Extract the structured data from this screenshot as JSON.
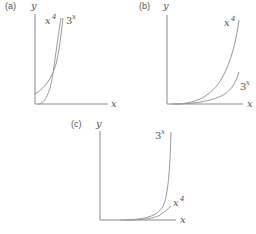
{
  "figure": {
    "panels": [
      {
        "id": "a",
        "label": "(a)",
        "y_axis_label": "y",
        "x_axis_label": "x",
        "curves": [
          {
            "name": "x4",
            "base": "x",
            "exponent": "4"
          },
          {
            "name": "3x",
            "base": "3",
            "exponent": "x"
          }
        ]
      },
      {
        "id": "b",
        "label": "(b)",
        "y_axis_label": "y",
        "x_axis_label": "x",
        "curves": [
          {
            "name": "x4",
            "base": "x",
            "exponent": "4"
          },
          {
            "name": "3x",
            "base": "3",
            "exponent": "x"
          }
        ]
      },
      {
        "id": "c",
        "label": "(c)",
        "y_axis_label": "y",
        "x_axis_label": "x",
        "curves": [
          {
            "name": "3x",
            "base": "3",
            "exponent": "x"
          },
          {
            "name": "x4",
            "base": "x",
            "exponent": "4"
          }
        ]
      }
    ],
    "colors": {
      "axis": "#8a8a8a",
      "curve": "#9a9a9a",
      "text": "#555555",
      "background": "#ffffff"
    }
  }
}
